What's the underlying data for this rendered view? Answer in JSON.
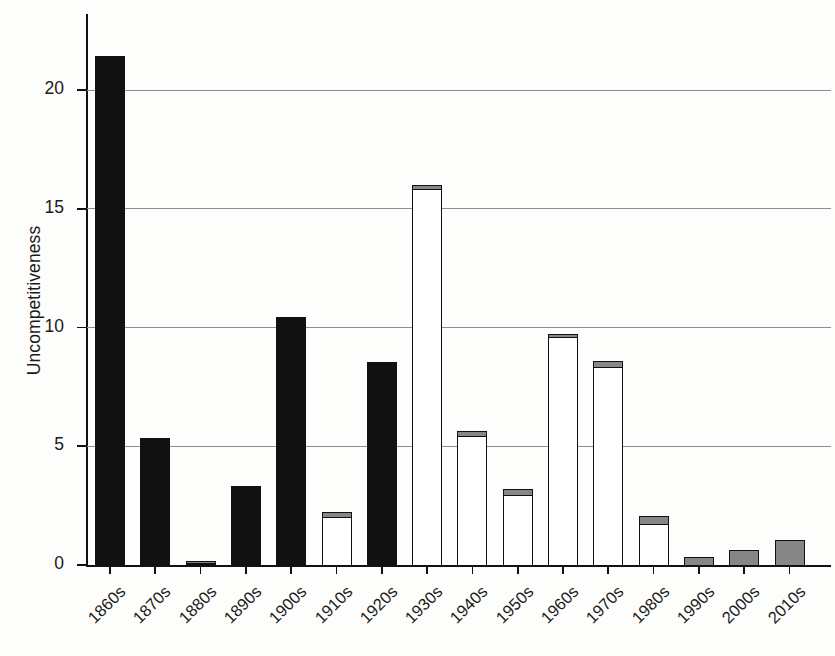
{
  "chart_data": {
    "type": "bar",
    "title": "",
    "subtitle": "",
    "xlabel": "",
    "ylabel": "Uncompetitiveness",
    "categories": [
      "1860s",
      "1870s",
      "1880s",
      "1890s",
      "1900s",
      "1910s",
      "1920s",
      "1930s",
      "1940s",
      "1950s",
      "1960s",
      "1970s",
      "1980s",
      "1990s",
      "2000s",
      "2010s"
    ],
    "values": [
      21.5,
      5.4,
      0.25,
      3.4,
      10.5,
      2.35,
      8.6,
      16.1,
      5.75,
      3.3,
      9.85,
      8.7,
      2.2,
      0.4,
      0.7,
      1.1
    ],
    "series": [
      {
        "name": "main",
        "values": [
          21.5,
          5.4,
          0.15,
          3.4,
          10.5,
          2.1,
          8.6,
          15.9,
          5.5,
          3.0,
          9.65,
          8.4,
          1.8,
          0.4,
          0.7,
          1.1
        ],
        "fills": [
          "black",
          "black",
          "black",
          "black",
          "black",
          "white",
          "black",
          "white",
          "white",
          "white",
          "white",
          "white",
          "white",
          "gray",
          "gray",
          "gray"
        ]
      },
      {
        "name": "cap",
        "values": [
          0,
          0,
          0.1,
          0,
          0,
          0.25,
          0,
          0.2,
          0.25,
          0.3,
          0.2,
          0.3,
          0.4,
          0,
          0,
          0
        ],
        "fills": [
          "gray",
          "gray",
          "gray",
          "gray",
          "gray",
          "gray",
          "gray",
          "gray",
          "gray",
          "gray",
          "gray",
          "gray",
          "gray",
          "gray",
          "gray",
          "gray"
        ]
      }
    ],
    "yticks": [
      0,
      5,
      10,
      15,
      20
    ],
    "ytick_labels": [
      "0",
      "5",
      "10",
      "15",
      "20"
    ],
    "ylim": [
      0,
      23.2
    ],
    "grid": "horizontal",
    "legend": "none",
    "colors": {
      "bar_black": "#111111",
      "bar_white": "#ffffff",
      "bar_gray": "#868686",
      "outline": "#111111",
      "gridline": "#8e8e8e",
      "axis": "#111111",
      "text": "#1a1a1a",
      "background": "#fdfdfc"
    }
  }
}
